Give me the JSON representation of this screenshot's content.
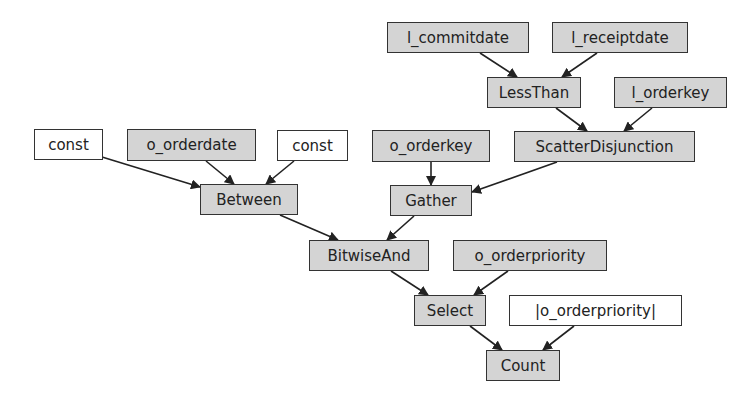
{
  "colors": {
    "operator_fill": "#d4d4d4",
    "input_fill": "#ffffff",
    "border": "#333333",
    "edge": "#222222",
    "text": "#222222"
  },
  "nodes": {
    "l_commitdate": {
      "label": "l_commitdate",
      "kind": "op"
    },
    "l_receiptdate": {
      "label": "l_receiptdate",
      "kind": "op"
    },
    "lessthan": {
      "label": "LessThan",
      "kind": "op"
    },
    "l_orderkey": {
      "label": "l_orderkey",
      "kind": "op"
    },
    "scatterdisjunction": {
      "label": "ScatterDisjunction",
      "kind": "op"
    },
    "const_1": {
      "label": "const",
      "kind": "input"
    },
    "o_orderdate": {
      "label": "o_orderdate",
      "kind": "op"
    },
    "const_2": {
      "label": "const",
      "kind": "input"
    },
    "o_orderkey": {
      "label": "o_orderkey",
      "kind": "op"
    },
    "between": {
      "label": "Between",
      "kind": "op"
    },
    "gather": {
      "label": "Gather",
      "kind": "op"
    },
    "bitwiseand": {
      "label": "BitwiseAnd",
      "kind": "op"
    },
    "o_orderpriority": {
      "label": "o_orderpriority",
      "kind": "op"
    },
    "select": {
      "label": "Select",
      "kind": "op"
    },
    "o_orderpriority_abs": {
      "label": "|o_orderpriority|",
      "kind": "input"
    },
    "count": {
      "label": "Count",
      "kind": "op"
    }
  },
  "edges": [
    [
      "l_commitdate",
      "lessthan"
    ],
    [
      "l_receiptdate",
      "lessthan"
    ],
    [
      "lessthan",
      "scatterdisjunction"
    ],
    [
      "l_orderkey",
      "scatterdisjunction"
    ],
    [
      "const_1",
      "between"
    ],
    [
      "o_orderdate",
      "between"
    ],
    [
      "const_2",
      "between"
    ],
    [
      "o_orderkey",
      "gather"
    ],
    [
      "scatterdisjunction",
      "gather"
    ],
    [
      "between",
      "bitwiseand"
    ],
    [
      "gather",
      "bitwiseand"
    ],
    [
      "bitwiseand",
      "select"
    ],
    [
      "o_orderpriority",
      "select"
    ],
    [
      "select",
      "count"
    ],
    [
      "o_orderpriority_abs",
      "count"
    ]
  ]
}
